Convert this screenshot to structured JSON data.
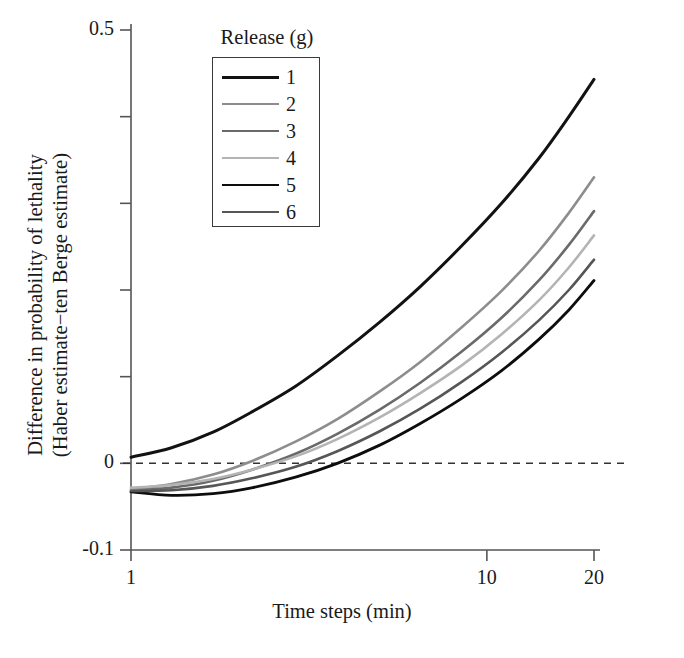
{
  "chart_data": {
    "type": "line",
    "title": "",
    "xlabel": "Time steps (min)",
    "ylabel": "Difference in probability of lethality\n(Haber estimate−ten Berge estimate)",
    "ylabel_lines": [
      "Difference in probability of lethality",
      "(Haber estimate−ten Berge estimate)"
    ],
    "xscale": "log",
    "yscale": "linear",
    "xlim": [
      1,
      20
    ],
    "ylim": [
      -0.1,
      0.5
    ],
    "grid": false,
    "xticks": [
      {
        "value": 1,
        "label": "1"
      },
      {
        "value": 10,
        "label": "10"
      },
      {
        "value": 20,
        "label": "20"
      }
    ],
    "yticks": [
      {
        "value": 0.5,
        "label": "0.5"
      },
      {
        "value": 0.4,
        "label": ""
      },
      {
        "value": 0.3,
        "label": ""
      },
      {
        "value": 0.2,
        "label": ""
      },
      {
        "value": 0.1,
        "label": ""
      },
      {
        "value": 0.0,
        "label": "0"
      },
      {
        "value": -0.1,
        "label": "-0.1"
      }
    ],
    "reference_line": {
      "y": 0,
      "style": "dashed",
      "color": "#333333"
    },
    "legend": {
      "title": "Release (g)",
      "position": "upper-center-inside",
      "boxed": true,
      "entries": [
        {
          "name": "1",
          "color": "#121212"
        },
        {
          "name": "2",
          "color": "#8d8d8d"
        },
        {
          "name": "3",
          "color": "#6a6a6a"
        },
        {
          "name": "4",
          "color": "#b4b4b4"
        },
        {
          "name": "5",
          "color": "#0d0d0d"
        },
        {
          "name": "6",
          "color": "#565656"
        }
      ]
    },
    "x": [
      1,
      1.3,
      1.7,
      2.2,
      2.9,
      3.8,
      5.0,
      6.5,
      8.5,
      11.0,
      14.0,
      17.0,
      20.0
    ],
    "series": [
      {
        "name": "1",
        "color": "#121212",
        "width": 3.0,
        "values": [
          0.007,
          0.018,
          0.036,
          0.06,
          0.089,
          0.124,
          0.163,
          0.204,
          0.251,
          0.3,
          0.352,
          0.4,
          0.443
        ]
      },
      {
        "name": "2",
        "color": "#8d8d8d",
        "width": 2.6,
        "values": [
          -0.03,
          -0.024,
          -0.013,
          0.003,
          0.025,
          0.051,
          0.083,
          0.117,
          0.157,
          0.199,
          0.245,
          0.289,
          0.33
        ]
      },
      {
        "name": "3",
        "color": "#6a6a6a",
        "width": 2.6,
        "values": [
          -0.032,
          -0.028,
          -0.02,
          -0.007,
          0.011,
          0.034,
          0.062,
          0.093,
          0.129,
          0.168,
          0.211,
          0.252,
          0.291
        ]
      },
      {
        "name": "4",
        "color": "#b4b4b4",
        "width": 2.6,
        "values": [
          -0.028,
          -0.025,
          -0.018,
          -0.007,
          0.008,
          0.028,
          0.053,
          0.081,
          0.113,
          0.149,
          0.188,
          0.226,
          0.263
        ]
      },
      {
        "name": "5",
        "color": "#0d0d0d",
        "width": 2.8,
        "values": [
          -0.033,
          -0.037,
          -0.035,
          -0.028,
          -0.016,
          0.0,
          0.021,
          0.046,
          0.075,
          0.107,
          0.143,
          0.177,
          0.211
        ]
      },
      {
        "name": "6",
        "color": "#565656",
        "width": 2.6,
        "values": [
          -0.032,
          -0.031,
          -0.026,
          -0.017,
          -0.004,
          0.014,
          0.037,
          0.063,
          0.094,
          0.128,
          0.165,
          0.2,
          0.235
        ]
      }
    ]
  },
  "axes": {
    "x_axis_name": "Time steps (min)",
    "y_axis_name": "Difference in probability of lethality (Haber estimate-ten Berge estimate)"
  }
}
